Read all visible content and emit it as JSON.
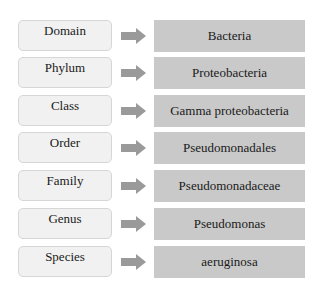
{
  "diagram": {
    "type": "taxonomy-hierarchy",
    "colors": {
      "rank_box_fill": "#f1f1f1",
      "rank_box_border": "#d6d6d6",
      "arrow": "#9a9a9a",
      "taxon_box_fill": "#c9c9c9",
      "text": "#1a1a1a"
    },
    "rows": [
      {
        "rank": "Domain",
        "taxon": "Bacteria"
      },
      {
        "rank": "Phylum",
        "taxon": "Proteobacteria"
      },
      {
        "rank": "Class",
        "taxon": "Gamma proteobacteria"
      },
      {
        "rank": "Order",
        "taxon": "Pseudomonadales"
      },
      {
        "rank": "Family",
        "taxon": "Pseudomonadaceae"
      },
      {
        "rank": "Genus",
        "taxon": "Pseudomonas"
      },
      {
        "rank": "Species",
        "taxon": "aeruginosa"
      }
    ]
  }
}
